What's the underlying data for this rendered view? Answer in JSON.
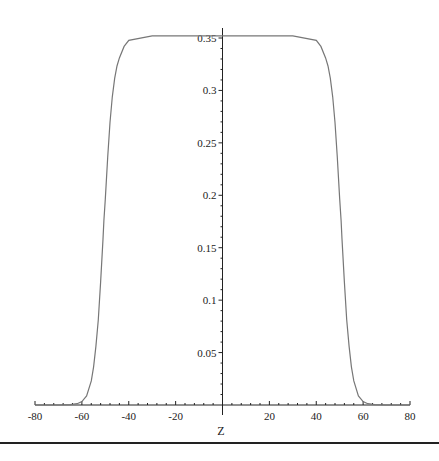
{
  "chart_data": {
    "type": "line",
    "title": "",
    "xlabel": "Z",
    "ylabel": "",
    "xlim": [
      -80,
      80
    ],
    "ylim": [
      0,
      0.36
    ],
    "x_ticks": [
      -80,
      -60,
      -40,
      -20,
      20,
      40,
      60,
      80
    ],
    "x_tick_labels": [
      "-80",
      "-60",
      "-40",
      "-20",
      "20",
      "40",
      "60",
      "80"
    ],
    "y_ticks": [
      0.05,
      0.1,
      0.15,
      0.2,
      0.25,
      0.3,
      0.35
    ],
    "y_tick_labels": [
      "0.05",
      "0.1",
      "0.15",
      "0.2",
      "0.25",
      "0.3",
      "0.35"
    ],
    "grid": false,
    "legend": null,
    "series": [
      {
        "name": "profile",
        "color": "#777777",
        "x": [
          -80,
          -70,
          -65,
          -62,
          -60,
          -58,
          -56,
          -55,
          -54,
          -53,
          -52,
          -51,
          -50.6,
          -50,
          -49,
          -48,
          -47,
          -46,
          -45,
          -44,
          -42,
          -40,
          -30,
          -20,
          -10,
          0,
          10,
          20,
          30,
          40,
          42,
          44,
          45,
          46,
          47,
          48,
          49,
          50,
          50.6,
          51,
          52,
          53,
          54,
          55,
          56,
          58,
          60,
          62,
          65,
          70,
          80
        ],
        "values": [
          0.0,
          0.0,
          0.0003,
          0.0012,
          0.0032,
          0.0087,
          0.023,
          0.0364,
          0.0559,
          0.0813,
          0.1169,
          0.1582,
          0.176,
          0.1964,
          0.2363,
          0.2694,
          0.2939,
          0.3117,
          0.3233,
          0.331,
          0.342,
          0.3478,
          0.352,
          0.352,
          0.352,
          0.352,
          0.352,
          0.352,
          0.352,
          0.3478,
          0.342,
          0.331,
          0.3233,
          0.3117,
          0.2939,
          0.2694,
          0.2363,
          0.1964,
          0.176,
          0.1582,
          0.1169,
          0.0813,
          0.0559,
          0.0364,
          0.023,
          0.0087,
          0.0032,
          0.0012,
          0.0003,
          0.0,
          0.0
        ]
      }
    ]
  }
}
